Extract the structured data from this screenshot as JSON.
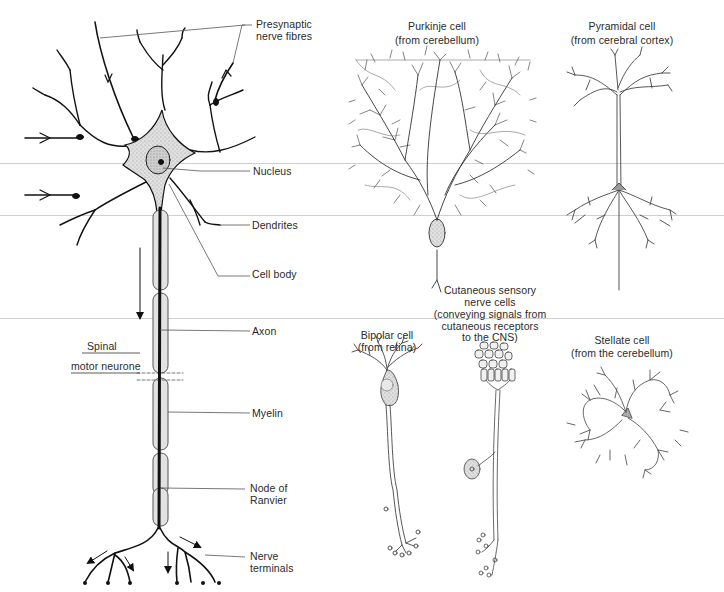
{
  "figure": {
    "motor_neurone": {
      "caption": [
        "Spinal",
        "motor neurone"
      ],
      "labels": {
        "presynaptic": [
          "Presynaptic",
          "nerve fibres"
        ],
        "nucleus": "Nucleus",
        "dendrites": "Dendrites",
        "cell_body": "Cell body",
        "axon": "Axon",
        "myelin": "Myelin",
        "node": [
          "Node of",
          "Ranvier"
        ],
        "terminals": [
          "Nerve",
          "terminals"
        ]
      }
    },
    "cells": [
      {
        "name": "Purkinje cell",
        "origin": "(from cerebellum)"
      },
      {
        "name": "Pyramidal cell",
        "origin": "(from cerebral cortex)"
      },
      {
        "name": "Bipolar cell",
        "origin": "(from retina)"
      },
      {
        "name": "Cutaneous sensory",
        "origin_lines": [
          "nerve cells",
          "(conveying signals from",
          "cutaneous receptors",
          "to the CNS)"
        ]
      },
      {
        "name": "Stellate cell",
        "origin": "(from the cerebellum)"
      }
    ],
    "colors": {
      "ink": "#1a1a1a",
      "soma_fill": "#d9d9d9",
      "myelin_fill": "#e2e2e2",
      "leader": "#555555"
    }
  }
}
